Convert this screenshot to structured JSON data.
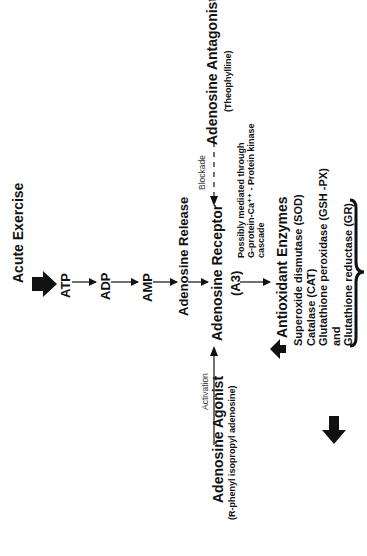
{
  "diagram": {
    "pathway": {
      "start": "Acute Exercise",
      "nodes": [
        "ATP",
        "ADP",
        "AMP",
        "Adenosine Release"
      ],
      "receptor": "Adenosine Receptor",
      "receptor_subtype": "(A3)"
    },
    "antagonist": {
      "name": "Adenosine Antagonist",
      "example": "(Theophylline)",
      "edge_label": "Blockade"
    },
    "agonist": {
      "name": "Adenosine Agonist",
      "example": "(R-phenyl isopropyl adenosine)",
      "edge_label": "Activation"
    },
    "mechanism": {
      "lines": [
        "Possibly mediated through",
        "G-protein-Ca⁺⁺ - Protein kinase",
        "cascade"
      ]
    },
    "enzymes": {
      "title": "Antioxidant Enzymes",
      "items": [
        "Superoxide dismutase (SOD)",
        "Catalase (CAT)",
        "Glutathione peroxidase (GSH -PX)",
        "and",
        "Glutathione reductase (GR)"
      ]
    },
    "colors": {
      "ink": "#111111",
      "background": "#ffffff"
    }
  }
}
